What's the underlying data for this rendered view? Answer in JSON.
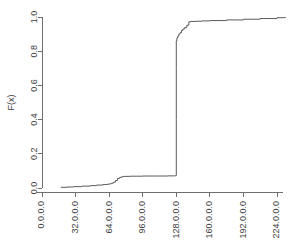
{
  "chart_data": {
    "type": "line",
    "title": "",
    "subtitle": "",
    "xlabel": "",
    "ylabel": "F(x)",
    "grid": false,
    "legend": null,
    "step_style": "ecdf-step-post",
    "x_tick_labels": [
      "0.0.0.0",
      "32.0.0.0",
      "64.0.0.0",
      "96.0.0.0",
      "128.0.0.0",
      "160.0.0.0",
      "192.0.0.0",
      "224.0.0.0"
    ],
    "x_tick_values": [
      0,
      32,
      64,
      96,
      128,
      160,
      192,
      224
    ],
    "y_tick_labels": [
      "0.0",
      "0.2",
      "0.4",
      "0.6",
      "0.8",
      "1.0"
    ],
    "y_tick_values": [
      0.0,
      0.2,
      0.4,
      0.6,
      0.8,
      1.0
    ],
    "xlim": [
      0,
      240
    ],
    "ylim": [
      0.0,
      1.0
    ],
    "x_units": "first octet of IPv4 address",
    "series": [
      {
        "name": "F(x)",
        "color": "#5a5a5a",
        "x": [
          18,
          24,
          30,
          38,
          46,
          52,
          58,
          62,
          64,
          66,
          68,
          70,
          72,
          74,
          76,
          78,
          84,
          96,
          110,
          120,
          126,
          127,
          127.4,
          127.8,
          128,
          128,
          128,
          128,
          128.6,
          129.4,
          130.4,
          131.6,
          133,
          134.4,
          136,
          138,
          140,
          142,
          146,
          152,
          160,
          176,
          192,
          208,
          224,
          232
        ],
        "values": [
          0.004,
          0.006,
          0.008,
          0.011,
          0.014,
          0.017,
          0.02,
          0.022,
          0.024,
          0.028,
          0.034,
          0.044,
          0.056,
          0.062,
          0.066,
          0.068,
          0.069,
          0.07,
          0.07,
          0.071,
          0.071,
          0.072,
          0.072,
          0.072,
          0.072,
          0.4,
          0.7,
          0.86,
          0.878,
          0.888,
          0.9,
          0.908,
          0.922,
          0.93,
          0.938,
          0.952,
          0.972,
          0.974,
          0.975,
          0.977,
          0.979,
          0.983,
          0.987,
          0.991,
          0.996,
          1.0
        ]
      }
    ],
    "annotations": [
      {
        "text": "near-vertical jump at 128.0.0.0 from F=0.07 to F=0.88"
      }
    ]
  }
}
